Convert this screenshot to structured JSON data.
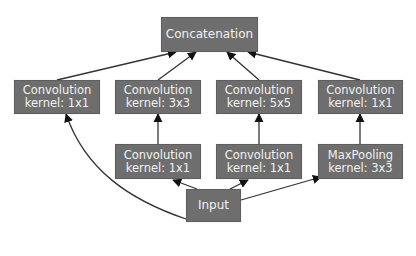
{
  "diagram": {
    "type": "inception-module",
    "colors": {
      "node_fill": "#6e6e6e",
      "node_text": "#f2f2f2",
      "edge": "#222222",
      "background": "#ffffff"
    },
    "nodes": {
      "concat": {
        "label": "Concatenation"
      },
      "conv_a": {
        "line1": "Convolution",
        "line2": "kernel: 1x1"
      },
      "conv_b": {
        "line1": "Convolution",
        "line2": "kernel: 3x3"
      },
      "conv_c": {
        "line1": "Convolution",
        "line2": "kernel: 5x5"
      },
      "conv_d": {
        "line1": "Convolution",
        "line2": "kernel: 1x1"
      },
      "reduce_b": {
        "line1": "Convolution",
        "line2": "kernel: 1x1"
      },
      "reduce_c": {
        "line1": "Convolution",
        "line2": "kernel: 1x1"
      },
      "pool": {
        "line1": "MaxPooling",
        "line2": "kernel: 3x3"
      },
      "input": {
        "label": "Input"
      }
    },
    "edges": [
      {
        "from": "input",
        "to": "conv_a"
      },
      {
        "from": "input",
        "to": "reduce_b"
      },
      {
        "from": "input",
        "to": "reduce_c"
      },
      {
        "from": "input",
        "to": "pool"
      },
      {
        "from": "reduce_b",
        "to": "conv_b"
      },
      {
        "from": "reduce_c",
        "to": "conv_c"
      },
      {
        "from": "pool",
        "to": "conv_d"
      },
      {
        "from": "conv_a",
        "to": "concat"
      },
      {
        "from": "conv_b",
        "to": "concat"
      },
      {
        "from": "conv_c",
        "to": "concat"
      },
      {
        "from": "conv_d",
        "to": "concat"
      }
    ]
  }
}
